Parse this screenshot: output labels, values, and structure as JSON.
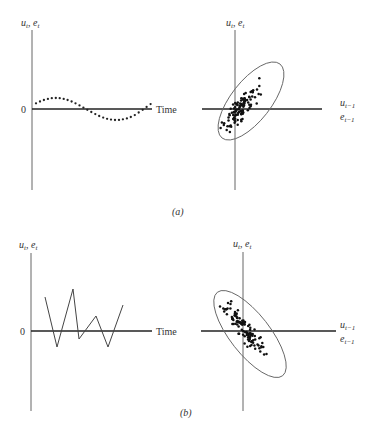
{
  "figure": {
    "panel_a": {
      "caption": "(a)",
      "time_plot": {
        "y_label_u": "u",
        "y_label_u_sub": "t",
        "y_label_e": "e",
        "y_label_e_sub": "t",
        "zero_label": "0",
        "x_label": "Time",
        "pattern": "smooth sinusoidal dotted series"
      },
      "scatter_plot": {
        "y_label_u": "u",
        "y_label_u_sub": "t",
        "y_label_e": "e",
        "y_label_e_sub": "t",
        "x_label_u": "u",
        "x_label_u_sub": "t−1",
        "x_label_e": "e",
        "x_label_e_sub": "t−1",
        "correlation": "positive"
      }
    },
    "panel_b": {
      "caption": "(b)",
      "time_plot": {
        "y_label_u": "u",
        "y_label_u_sub": "t",
        "y_label_e": "e",
        "y_label_e_sub": "t",
        "zero_label": "0",
        "x_label": "Time",
        "pattern": "alternating zigzag line"
      },
      "scatter_plot": {
        "y_label_u": "u",
        "y_label_u_sub": "t",
        "y_label_e": "e",
        "y_label_e_sub": "t",
        "x_label_u": "u",
        "x_label_u_sub": "t−1",
        "x_label_e": "e",
        "x_label_e_sub": "t−1",
        "correlation": "negative"
      }
    },
    "colors": {
      "ink": "#222222",
      "axis": "#555555",
      "ellipse": "#666666"
    }
  }
}
